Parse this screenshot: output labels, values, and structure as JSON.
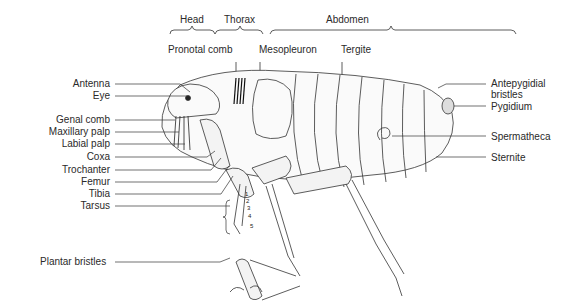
{
  "diagram": {
    "regions": [
      {
        "label": "Head"
      },
      {
        "label": "Thorax"
      },
      {
        "label": "Abdomen"
      }
    ],
    "top_labels": [
      {
        "label": "Pronotal comb"
      },
      {
        "label": "Mesopleuron"
      },
      {
        "label": "Tergite"
      }
    ],
    "left_labels": [
      {
        "label": "Antenna"
      },
      {
        "label": "Eye"
      },
      {
        "label": "Genal comb"
      },
      {
        "label": "Maxillary palp"
      },
      {
        "label": "Labial palp"
      },
      {
        "label": "Coxa"
      },
      {
        "label": "Trochanter"
      },
      {
        "label": "Femur"
      },
      {
        "label": "Tibia"
      },
      {
        "label": "Tarsus"
      }
    ],
    "right_labels": [
      {
        "label": "Antepygidial\nbristles",
        "line1": "Antepygidial",
        "line2": "bristles"
      },
      {
        "label": "Pygidium"
      },
      {
        "label": "Spermatheca"
      },
      {
        "label": "Sternite"
      }
    ],
    "bottom_labels": [
      {
        "label": "Plantar bristles"
      }
    ],
    "tarsal_segments": [
      "1",
      "2",
      "3",
      "4",
      "5"
    ]
  }
}
